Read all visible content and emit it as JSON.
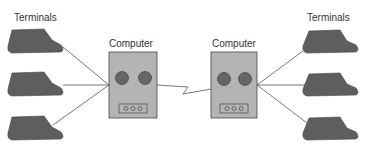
{
  "diagram": {
    "left_group": {
      "label": "Terminals",
      "terminals": [
        "terminal-1",
        "terminal-2",
        "terminal-3"
      ]
    },
    "left_computer": {
      "label": "Computer"
    },
    "right_computer": {
      "label": "Computer"
    },
    "right_group": {
      "label": "Terminals",
      "terminals": [
        "terminal-1",
        "terminal-2",
        "terminal-3"
      ]
    },
    "link": {
      "type": "zigzag-communication-line"
    },
    "colors": {
      "terminal_fill": "#5e5e5e",
      "computer_fill": "#b4b4b4",
      "disk_fill": "#666666",
      "line": "#555555",
      "background": "#ffffff"
    }
  }
}
